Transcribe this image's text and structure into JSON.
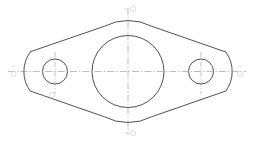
{
  "document": {
    "title": "Flange Gasket Plate - Orthographic View",
    "view_type": "front-view",
    "background_color": "#ffffff",
    "line_color": "#3c3c46",
    "centerline_color": "#8e8e99",
    "marker_color": "#cfcfd6"
  },
  "canvas": {
    "width": 254,
    "height": 143
  },
  "geometry": {
    "central_bore": {
      "label": "central-bore",
      "cx": 128,
      "cy": 71.5,
      "r": 36
    },
    "hub_outer": {
      "label": "hub-outer-arc",
      "cx": 128,
      "cy": 71.5,
      "r": 51
    },
    "left_boss": {
      "label": "left-boss-arc",
      "cx": 55,
      "cy": 71.5,
      "r": 33
    },
    "right_boss": {
      "label": "right-boss-arc",
      "cx": 201,
      "cy": 71.5,
      "r": 33
    },
    "left_hole": {
      "label": "left-bolt-hole",
      "cx": 55,
      "cy": 71.5,
      "r": 12.5
    },
    "right_hole": {
      "label": "right-bolt-hole",
      "cx": 201,
      "cy": 71.5,
      "r": 12.5
    }
  },
  "centerlines": {
    "horizontal": {
      "label": "horizontal-centerline",
      "x1": 8,
      "x2": 246,
      "y": 71.5
    },
    "vertical": {
      "label": "vertical-centerline",
      "y1": 8,
      "y2": 135,
      "x": 128
    },
    "left_hole_vertical": {
      "label": "left-hole-vertical-centerline",
      "x": 55,
      "y1": 52,
      "y2": 94
    },
    "right_hole_vertical": {
      "label": "right-hole-vertical-centerline",
      "x": 201,
      "y1": 52,
      "y2": 94
    }
  },
  "markers": [
    {
      "id": "marker-top",
      "position": "top",
      "x": 131,
      "y": 9,
      "text": "• 0"
    },
    {
      "id": "marker-bottom",
      "position": "bottom",
      "x": 131,
      "y": 133,
      "text": "• 0"
    },
    {
      "id": "marker-left",
      "position": "left",
      "x": 9,
      "y": 69,
      "text": "•"
    },
    {
      "id": "marker-right",
      "position": "right",
      "x": 241,
      "y": 69,
      "text": "•"
    },
    {
      "id": "marker-lower-left",
      "position": "lower-left",
      "x": 44,
      "y": 95,
      "text": "• 0"
    }
  ],
  "labels": {
    "drawing_caption": ""
  }
}
